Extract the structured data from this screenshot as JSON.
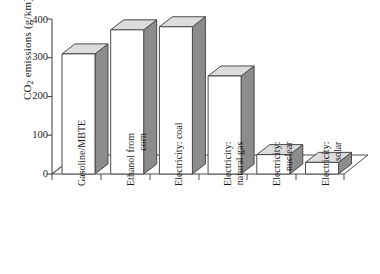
{
  "chart_data": {
    "type": "bar",
    "title": "",
    "subtitle": "",
    "xlabel": "",
    "ylabel": "CO2 emissions (g/km)",
    "ylabel_parts": {
      "pre": "CO",
      "sub": "2",
      "post": " emissions (g/km)"
    },
    "categories": [
      "Gasoline/MBTE",
      "Ethanol from corn",
      "Electricity: coal",
      "Electricity: natural gas",
      "Electricity: nuclear",
      "Electricity: solar"
    ],
    "category_lines": [
      [
        "Gasoline/MBTE"
      ],
      [
        "Ethanol from",
        "corn"
      ],
      [
        "Electricity: coal"
      ],
      [
        "Electricity:",
        "natural gas"
      ],
      [
        "Electricity:",
        "nuclear"
      ],
      [
        "Electricity:",
        "solar"
      ]
    ],
    "values": [
      310,
      372,
      380,
      253,
      50,
      30
    ],
    "ylim": [
      0,
      400
    ],
    "yticks": [
      0,
      100,
      200,
      300,
      400
    ],
    "ytick_labels": [
      "0",
      "100",
      "200",
      "300",
      "400"
    ],
    "grid": false,
    "legend": false,
    "style": "3d-bars",
    "colors": {
      "bar_front": "#ffffff",
      "bar_side": "#8c8c8c",
      "bar_top": "#dcdcdc",
      "outline": "#4a4a4a",
      "axis": "#4a4a4a",
      "text": "#1a1a1a",
      "floor": "#ffffff"
    }
  }
}
